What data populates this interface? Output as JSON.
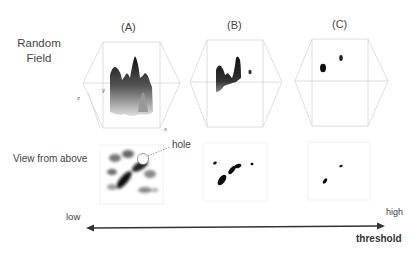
{
  "row_labels": {
    "random_field_line1": "Random",
    "random_field_line2": "Field",
    "view_from_above": "View from above"
  },
  "panels": [
    {
      "id": "A",
      "title": "(A)",
      "axes": {
        "x": "x",
        "y": "y",
        "z": "z"
      }
    },
    {
      "id": "B",
      "title": "(B)"
    },
    {
      "id": "C",
      "title": "(C)"
    }
  ],
  "annotations": {
    "hole": "hole"
  },
  "threshold_axis": {
    "low": "low",
    "high": "high",
    "label": "threshold"
  },
  "colors": {
    "box_edge": "#d8d8d8",
    "surface_dark": "#1a1a1a",
    "arrow": "#333333"
  }
}
